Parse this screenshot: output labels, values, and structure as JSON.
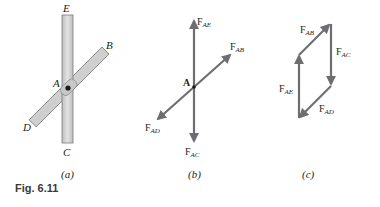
{
  "figure": {
    "caption": "Fig. 6.11",
    "colors": {
      "rod_fill": "#cfcfcf",
      "rod_stroke": "#7a7a7a",
      "arrow": "#6d6e71",
      "text": "#231f20"
    }
  },
  "panels": [
    {
      "id": "a",
      "label": "(a)",
      "description": "Two bars pinned at A",
      "points": {
        "A": "A",
        "B": "B",
        "C": "C",
        "D": "D",
        "E": "E"
      }
    },
    {
      "id": "b",
      "label": "(b)",
      "description": "Free-body diagram of pin A",
      "point": "A",
      "forces": {
        "AE": {
          "main": "F",
          "sub": "AE"
        },
        "AB": {
          "main": "F",
          "sub": "AB"
        },
        "AD": {
          "main": "F",
          "sub": "AD"
        },
        "AC": {
          "main": "F",
          "sub": "AC"
        }
      }
    },
    {
      "id": "c",
      "label": "(c)",
      "description": "Force polygon",
      "forces": {
        "AB": {
          "main": "F",
          "sub": "AB"
        },
        "AC": {
          "main": "F",
          "sub": "AC"
        },
        "AE": {
          "main": "F",
          "sub": "AE"
        },
        "AD": {
          "main": "F",
          "sub": "AD"
        }
      }
    }
  ]
}
